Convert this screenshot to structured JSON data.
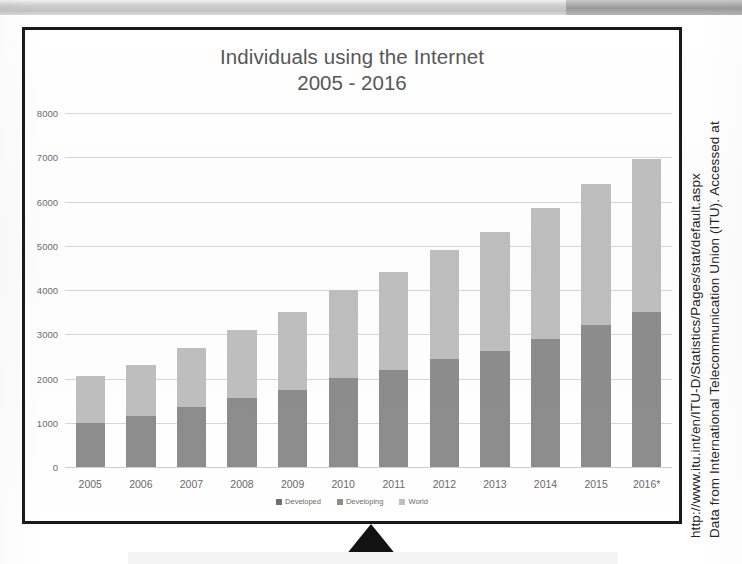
{
  "chart_data": {
    "type": "bar",
    "subtype": "stacked-bar",
    "title": "Individuals using the Internet",
    "subtitle": "2005 - 2016",
    "xlabel": "",
    "ylabel": "",
    "ylim": [
      0,
      8000
    ],
    "ytick_step": 1000,
    "yticks": [
      "8000",
      "7000",
      "6000",
      "5000",
      "4000",
      "3000",
      "2000",
      "1000",
      "0"
    ],
    "grid": true,
    "legend_position": "bottom",
    "categories": [
      "2005",
      "2006",
      "2007",
      "2008",
      "2009",
      "2010",
      "2011",
      "2012",
      "2013",
      "2014",
      "2015",
      "2016*"
    ],
    "series": [
      {
        "name": "Developed",
        "color": "#6f6f6f",
        "values": [
          0,
          0,
          0,
          0,
          0,
          0,
          0,
          0,
          0,
          0,
          0,
          0
        ]
      },
      {
        "name": "Developing",
        "color": "#8d8d8d",
        "values": [
          1000,
          1150,
          1350,
          1550,
          1750,
          2020,
          2200,
          2430,
          2630,
          2900,
          3200,
          3500
        ]
      },
      {
        "name": "World",
        "color": "#bfbfbf",
        "values": [
          1050,
          1150,
          1350,
          1550,
          1750,
          1980,
          2200,
          2470,
          2670,
          2950,
          3200,
          3450
        ]
      }
    ],
    "totals": [
      2050,
      2300,
      2700,
      3100,
      3500,
      4000,
      4400,
      4900,
      5300,
      5850,
      6400,
      6950
    ]
  },
  "source_note": {
    "line1": "Data from International Telecommunication Union (ITU). Accessed at",
    "line2": "http://www.itu.int/en/ITU-D/Statistics/Pages/stat/default.aspx"
  },
  "colors": {
    "frame": "#1a1a1a",
    "world": "#bfbfbf",
    "developing": "#8d8d8d",
    "developed": "#6f6f6f",
    "grid": "#d7d7d7",
    "text": "#575757",
    "pointer": "#121212"
  }
}
